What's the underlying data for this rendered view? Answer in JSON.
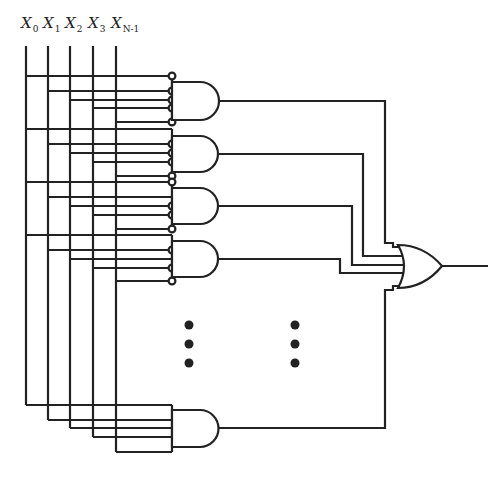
{
  "diagram": {
    "inputs": [
      {
        "name": "X",
        "sub": "0",
        "x": 26
      },
      {
        "name": "X",
        "sub": "1",
        "x": 48
      },
      {
        "name": "X",
        "sub": "2",
        "x": 70
      },
      {
        "name": "X",
        "sub": "3",
        "x": 93
      },
      {
        "name": "X",
        "sub": "N-1",
        "x": 116
      }
    ],
    "and_gates": [
      {
        "id": "and-1",
        "top": 82,
        "bottom": 120,
        "inputs": [
          {
            "src": 0,
            "y": 76,
            "inverted": true
          },
          {
            "src": 1,
            "y": 91,
            "inverted": true
          },
          {
            "src": 2,
            "y": 100,
            "inverted": true
          },
          {
            "src": 3,
            "y": 108,
            "inverted": true
          },
          {
            "src": 4,
            "y": 122,
            "inverted": true
          }
        ]
      },
      {
        "id": "and-2",
        "top": 136,
        "bottom": 172,
        "inputs": [
          {
            "src": 0,
            "y": 129,
            "inverted": false
          },
          {
            "src": 1,
            "y": 144,
            "inverted": true
          },
          {
            "src": 2,
            "y": 153,
            "inverted": true
          },
          {
            "src": 3,
            "y": 162,
            "inverted": true
          },
          {
            "src": 4,
            "y": 176,
            "inverted": true
          }
        ]
      },
      {
        "id": "and-3",
        "top": 188,
        "bottom": 224,
        "inputs": [
          {
            "src": 0,
            "y": 182,
            "inverted": true
          },
          {
            "src": 1,
            "y": 197,
            "inverted": false
          },
          {
            "src": 2,
            "y": 206,
            "inverted": true
          },
          {
            "src": 3,
            "y": 215,
            "inverted": true
          },
          {
            "src": 4,
            "y": 229,
            "inverted": true
          }
        ]
      },
      {
        "id": "and-4",
        "top": 241,
        "bottom": 277,
        "inputs": [
          {
            "src": 0,
            "y": 235,
            "inverted": false
          },
          {
            "src": 1,
            "y": 250,
            "inverted": true
          },
          {
            "src": 2,
            "y": 259,
            "inverted": false
          },
          {
            "src": 3,
            "y": 268,
            "inverted": true
          },
          {
            "src": 4,
            "y": 281,
            "inverted": true
          }
        ]
      },
      {
        "id": "and-last",
        "top": 410,
        "bottom": 447,
        "inputs": [
          {
            "src": 0,
            "y": 405,
            "inverted": false
          },
          {
            "src": 1,
            "y": 420,
            "inverted": false
          },
          {
            "src": 2,
            "y": 428,
            "inverted": false
          },
          {
            "src": 3,
            "y": 437,
            "inverted": false
          },
          {
            "src": 4,
            "y": 452,
            "inverted": false
          }
        ]
      }
    ],
    "or_gate": {
      "id": "or-1",
      "inputs_count": 5,
      "output": "Y"
    },
    "ellipsis": [
      "⋮",
      "⋮"
    ],
    "colors": {
      "line": "#222222",
      "background": "#ffffff"
    }
  }
}
